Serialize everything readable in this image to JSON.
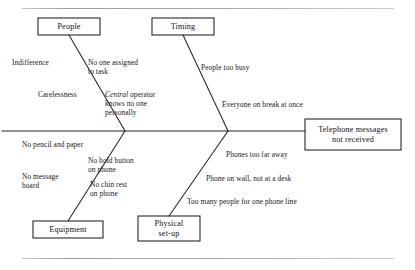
{
  "diagram": {
    "type": "fishbone-cause-and-effect",
    "effect": {
      "label": "Telephone messages\nnot received",
      "box": {
        "x": 305,
        "y": 119,
        "w": 96,
        "h": 31
      }
    },
    "spine": {
      "y": 131,
      "x_start": 2,
      "x_end": 305
    },
    "frame": {
      "top_rule_y": 8,
      "bottom_rule_y": 258
    },
    "categories": [
      {
        "id": "people",
        "label": "People",
        "position": "top-left",
        "box": {
          "x": 38,
          "y": 18,
          "w": 62,
          "h": 17
        },
        "causes": [
          {
            "text": "Indifference",
            "x": 12,
            "y": 58,
            "align": "left"
          },
          {
            "text": "No one assigned\nto task",
            "x": 88,
            "y": 58,
            "align": "left"
          },
          {
            "text": "Carelessness",
            "x": 38,
            "y": 90,
            "align": "left"
          },
          {
            "text": "Central operator\nknows no one\npersonally",
            "x": 105,
            "y": 90,
            "align": "left",
            "italic_first_word": true
          }
        ]
      },
      {
        "id": "timing",
        "label": "Timing",
        "position": "top-right",
        "box": {
          "x": 152,
          "y": 18,
          "w": 62,
          "h": 17
        },
        "causes": [
          {
            "text": "People too busy",
            "x": 201,
            "y": 63,
            "align": "left"
          },
          {
            "text": "Everyone on break at once",
            "x": 222,
            "y": 100,
            "align": "left"
          }
        ]
      },
      {
        "id": "equipment",
        "label": "Equipment",
        "position": "bottom-left",
        "box": {
          "x": 33,
          "y": 221,
          "w": 70,
          "h": 17
        },
        "causes": [
          {
            "text": "No pencil and paper",
            "x": 22,
            "y": 140,
            "align": "left"
          },
          {
            "text": "No hold button\non phone",
            "x": 88,
            "y": 156,
            "align": "left"
          },
          {
            "text": "No message\nboard",
            "x": 22,
            "y": 172,
            "align": "left"
          },
          {
            "text": "No chin rest\non phone",
            "x": 90,
            "y": 180,
            "align": "left"
          }
        ]
      },
      {
        "id": "physical-setup",
        "label": "Physical\nset-up",
        "position": "bottom-right",
        "box": {
          "x": 138,
          "y": 216,
          "w": 62,
          "h": 25
        },
        "causes": [
          {
            "text": "Phones too far away",
            "x": 226,
            "y": 150,
            "align": "left"
          },
          {
            "text": "Phone on wall, not at a desk",
            "x": 206,
            "y": 174,
            "align": "left"
          },
          {
            "text": "Too many people for one phone line",
            "x": 187,
            "y": 197,
            "align": "left"
          }
        ]
      }
    ],
    "colors": {
      "line": "#23252a",
      "text": "#17181a",
      "box_border": "#1d1f22",
      "background": "#ffffff",
      "rule": "#9a9a9a"
    }
  }
}
